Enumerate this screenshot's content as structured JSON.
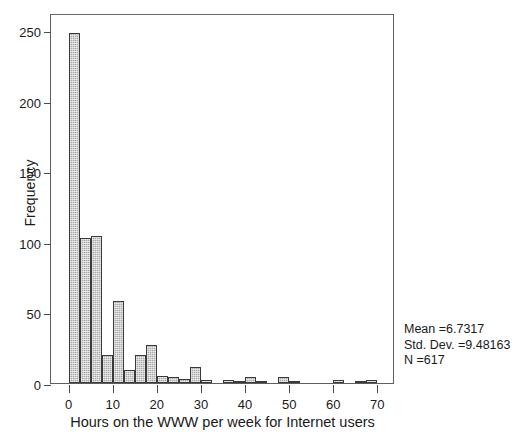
{
  "chart_data": {
    "type": "bar",
    "title": "",
    "subtitle": "",
    "xlabel": "Hours on the WWW per week for Internet users",
    "ylabel": "Frequency",
    "xlim": [
      -4,
      74
    ],
    "ylim": [
      0,
      262
    ],
    "grid": false,
    "legend": null,
    "bin_width": 2.5,
    "x_ticks": [
      0,
      10,
      20,
      30,
      40,
      50,
      60,
      70
    ],
    "x_tick_labels": [
      "0",
      "10",
      "20",
      "30",
      "40",
      "50",
      "60",
      "70"
    ],
    "y_ticks": [
      0,
      50,
      100,
      150,
      200,
      250
    ],
    "y_tick_labels": [
      "0",
      "50",
      "100",
      "150",
      "200",
      "250"
    ],
    "bin_starts": [
      0.0,
      2.5,
      5.0,
      7.5,
      10.0,
      12.5,
      15.0,
      17.5,
      20.0,
      22.5,
      25.0,
      27.5,
      30.0,
      32.5,
      35.0,
      37.5,
      40.0,
      42.5,
      45.0,
      47.5,
      50.0,
      57.5,
      60.0,
      65.0,
      67.5
    ],
    "categories": [
      "0-2.5",
      "2.5-5",
      "5-7.5",
      "7.5-10",
      "10-12.5",
      "12.5-15",
      "15-17.5",
      "17.5-20",
      "20-22.5",
      "22.5-25",
      "25-27.5",
      "27.5-30",
      "30-32.5",
      "32.5-35",
      "35-37.5",
      "37.5-40",
      "40-42.5",
      "42.5-45",
      "45-47.5",
      "47.5-50",
      "50-52.5",
      "57.5-60",
      "60-62.5",
      "65-67.5",
      "67.5-70"
    ],
    "values": [
      248,
      103,
      104,
      20,
      58,
      9,
      20,
      27,
      5,
      4,
      3,
      11,
      2,
      0,
      2,
      1,
      4,
      1,
      0,
      4,
      1,
      0,
      2,
      1,
      2
    ],
    "bar_fill_color": "#a9a9a9",
    "bar_edge_color": "#3a3a3a",
    "frame_color": "#5e5e5e",
    "background_color": "#ffffff"
  },
  "annotations": {
    "mean": "Mean =6.7317",
    "std_dev": "Std. Dev. =9.48163",
    "n": "N =617"
  }
}
